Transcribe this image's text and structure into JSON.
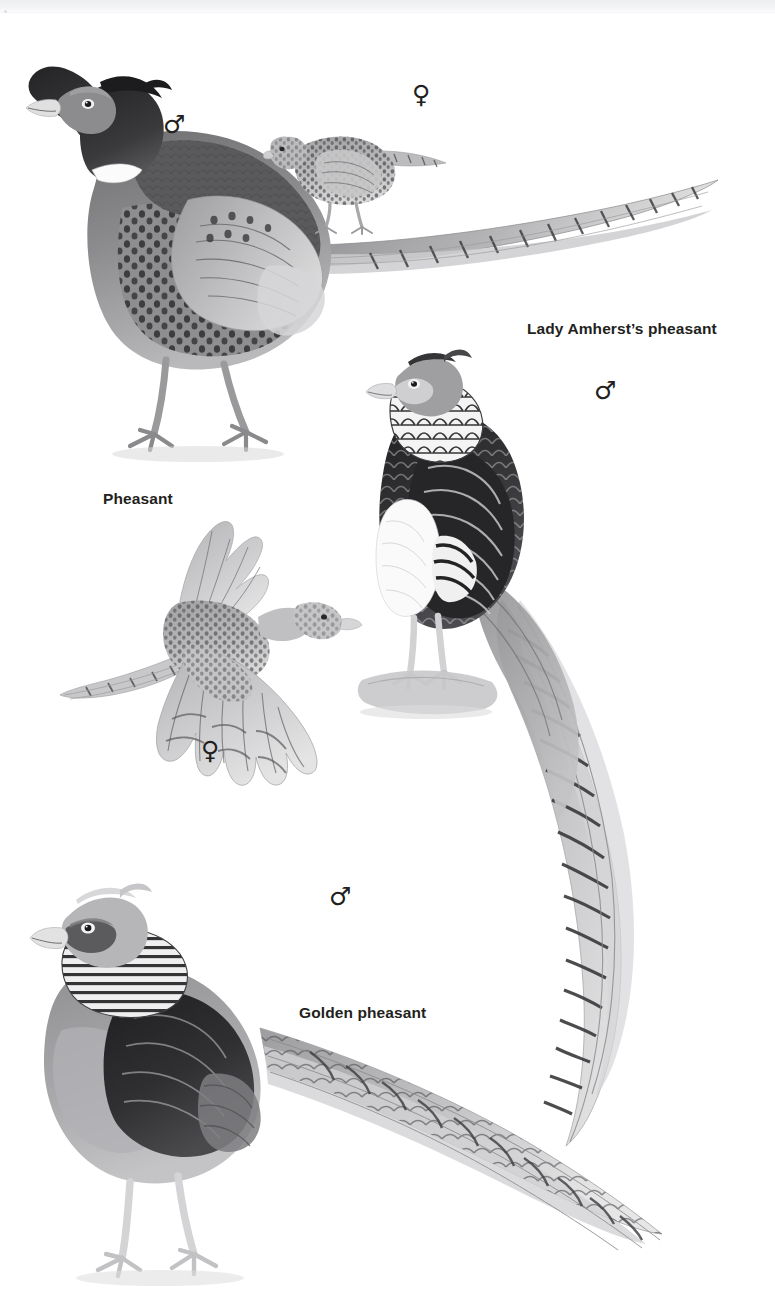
{
  "page": {
    "width": 775,
    "height": 1304,
    "background_color": "#ffffff",
    "kind": "field-guide-illustration-plate",
    "header_band_text": "",
    "ink_color": "#231f20"
  },
  "labels": [
    {
      "id": "lady-amhersts-pheasant",
      "text": "Lady Amherst’s pheasant",
      "x": 527,
      "y": 327
    },
    {
      "id": "pheasant",
      "text": "Pheasant",
      "x": 103,
      "y": 497
    },
    {
      "id": "golden-pheasant",
      "text": "Golden pheasant",
      "x": 299,
      "y": 1011
    }
  ],
  "sex_symbols": [
    {
      "id": "pheasant-male",
      "glyph": "♂",
      "name": "male-symbol",
      "x": 165,
      "y": 119
    },
    {
      "id": "pheasant-female",
      "glyph": "♀",
      "name": "female-symbol",
      "x": 414,
      "y": 88
    },
    {
      "id": "amherst-male",
      "glyph": "♂",
      "name": "male-symbol",
      "x": 596,
      "y": 385
    },
    {
      "id": "pheasant-flight-female",
      "glyph": "♀",
      "name": "female-symbol",
      "x": 203,
      "y": 745
    },
    {
      "id": "golden-male",
      "glyph": "♂",
      "name": "male-symbol",
      "x": 331,
      "y": 891
    }
  ],
  "illustrations": [
    {
      "id": "bird-pheasant-male",
      "species": "Pheasant",
      "sex": "male",
      "pose": "standing, long barred tail to right"
    },
    {
      "id": "bird-pheasant-female",
      "species": "Pheasant",
      "sex": "female",
      "pose": "standing, small, mottled"
    },
    {
      "id": "bird-amherst-male",
      "species": "Lady Amherst’s pheasant",
      "sex": "male",
      "pose": "perched on rock, very long barred tail trailing down"
    },
    {
      "id": "bird-pheasant-flight",
      "species": "Pheasant",
      "sex": "female",
      "pose": "in flight, wings spread"
    },
    {
      "id": "bird-golden-male",
      "species": "Golden pheasant",
      "sex": "male",
      "pose": "standing, long tail to right"
    }
  ],
  "palette": {
    "ink": "#231f20",
    "dark": "#2b2b2d",
    "mid_dark": "#565658",
    "mid": "#7d7d80",
    "light_mid": "#a6a6a9",
    "light": "#c8c8ca",
    "pale": "#e2e2e3",
    "near_white": "#f4f4f4",
    "header_band": "#eceef0"
  }
}
